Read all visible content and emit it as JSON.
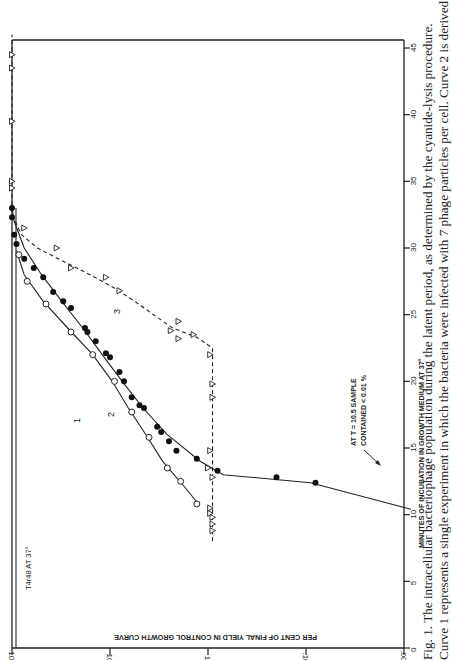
{
  "chart_data": {
    "type": "scatter",
    "orientation": "rotated 90 degrees clockwise on page",
    "title": "T4r48 AT 37°",
    "xlabel": "MINUTES OF INCUBATION IN GROWTH MEDIUM AT 37°",
    "ylabel": "PER CENT OF FINAL YIELD IN CONTROL GROWTH CURVE",
    "xlim": [
      0,
      45
    ],
    "ylim": [
      0.01,
      100
    ],
    "yscale": "log",
    "x_ticks": [
      "0",
      "5",
      "10",
      "15",
      "20",
      "25",
      "30",
      "35",
      "40",
      "45"
    ],
    "y_ticks": [
      "100",
      "10",
      "1",
      "0.1",
      "0.01"
    ],
    "y_tick_labels_display": [
      "100",
      "10",
      "1",
      ".10",
      ".001"
    ],
    "grid": false,
    "annotation": {
      "line1": "AT T = 10.5 SAMPLE",
      "line2": "CONTAINED < 0.01 %"
    },
    "curve_labels": [
      "1",
      "2",
      "3"
    ],
    "series": [
      {
        "name": "1",
        "marker": "open-circle",
        "line": "solid",
        "x": [
          10.8,
          12.5,
          13.5,
          15.8,
          17.7,
          20.0,
          22.0,
          23.7,
          25.8,
          27.5,
          29.5
        ],
        "y": [
          1.3,
          1.9,
          2.6,
          4.0,
          6.0,
          9.0,
          15,
          25,
          45,
          70,
          85
        ]
      },
      {
        "name": "2",
        "marker": "filled-circle",
        "line": "solid",
        "x": [
          12.4,
          12.8,
          13.3,
          14.2,
          14.8,
          15.5,
          16.2,
          16.6,
          18.0,
          18.2,
          18.8,
          20.0,
          20.7,
          21.8,
          22.1,
          23.0,
          23.7,
          24.0,
          25.5,
          26.0,
          26.7,
          27.8,
          28.5,
          29.2,
          30.3,
          31.0,
          32.3,
          33.0
        ],
        "y": [
          0.08,
          0.2,
          0.8,
          1.3,
          2.1,
          2.5,
          3.0,
          3.3,
          4.5,
          5.0,
          6.0,
          7.2,
          8.0,
          10.0,
          11,
          14,
          17,
          18,
          25,
          30,
          38,
          48,
          60,
          75,
          90,
          95,
          100,
          100
        ]
      },
      {
        "name": "3",
        "marker": "open-triangle",
        "line": "dashed",
        "x": [
          8.8,
          9.3,
          9.8,
          10.1,
          10.5,
          12.8,
          13.5,
          14.8,
          18.8,
          19.8,
          22.0,
          23.2,
          23.5,
          23.8,
          24.5,
          26.8,
          27.8,
          28.5,
          30.0,
          31.5,
          34.5,
          35.0,
          39.5,
          43.5,
          44.5
        ],
        "y": [
          0.9,
          0.9,
          0.9,
          0.95,
          0.95,
          0.9,
          1.0,
          0.95,
          0.9,
          0.9,
          0.95,
          2.0,
          1.4,
          2.4,
          2.0,
          8.0,
          11,
          25,
          35,
          75,
          100,
          100,
          100,
          100,
          100
        ]
      }
    ],
    "control_flat_line": {
      "marker": "open-triangle",
      "line": "dashed",
      "y": 100,
      "x_range": [
        34,
        46
      ]
    }
  },
  "figure": {
    "axis_title_x": "MINUTES OF INCUBATION IN GROWTH MEDIUM AT 37°",
    "axis_title_y": "PER CENT OF FINAL YIELD IN CONTROL GROWTH CURVE",
    "strain_label": "T4r48 AT 37°",
    "annotation_line1": "AT  T = 10.5  SAMPLE",
    "annotation_line2": "CONTAINED  < 0.01 %",
    "curve_label_1": "1",
    "curve_label_2": "2",
    "curve_label_3": "3",
    "x_tick_labels": [
      "0",
      "5",
      "10",
      "15",
      "20",
      "25",
      "30",
      "35",
      "40",
      "45"
    ],
    "y_tick_labels": [
      "100",
      "10",
      "1",
      ".10",
      ".001"
    ]
  },
  "caption": {
    "line1": "Fig. 1.  The intracellular bacteriophage population during the latent period, as determined by the cyanide-lysis procedure.",
    "line2": "Curve 1 represents a single experiment in which the bacteria were infected with 7 phage particles per cell.  Curve 2 is derived from"
  }
}
